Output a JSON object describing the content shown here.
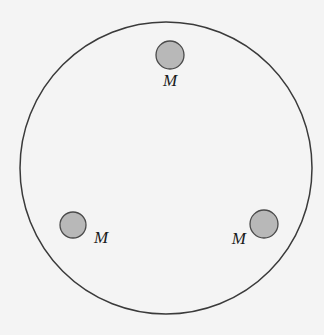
{
  "diagram": {
    "outer_circle": {
      "cx": 166,
      "cy": 168,
      "r": 146,
      "stroke": "#3a3a3a"
    },
    "masses": [
      {
        "id": "top",
        "label": "M",
        "cx": 170,
        "cy": 55,
        "r": 14,
        "label_x": 170,
        "label_y": 86,
        "anchor": "middle"
      },
      {
        "id": "bottom-left",
        "label": "M",
        "cx": 73,
        "cy": 225,
        "r": 13,
        "label_x": 94,
        "label_y": 243,
        "anchor": "start"
      },
      {
        "id": "bottom-right",
        "label": "M",
        "cx": 264,
        "cy": 224,
        "r": 14,
        "label_x": 246,
        "label_y": 244,
        "anchor": "end"
      }
    ],
    "mass_fill": "#b8b8b8",
    "mass_stroke": "#4a4a4a"
  }
}
